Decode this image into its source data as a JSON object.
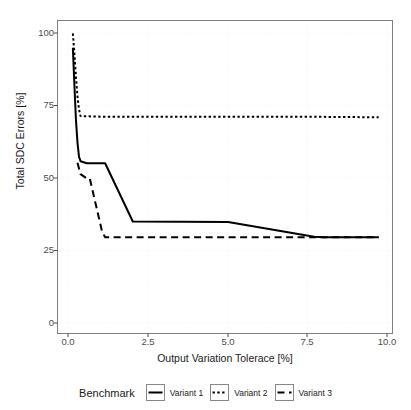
{
  "chart_data": {
    "type": "line",
    "title": "",
    "subtitle": "",
    "xlabel": "Output Variation Tolerace [%]",
    "ylabel": "Total SDC Errors [%]",
    "xlim": [
      -0.45,
      10.45
    ],
    "ylim": [
      -4.5,
      104.5
    ],
    "xticks": [
      0.0,
      2.5,
      5.0,
      7.5,
      10.0
    ],
    "xtick_labels": [
      "0.0",
      "2.5",
      "5.0",
      "7.5",
      "10.0"
    ],
    "yticks": [
      0,
      25,
      50,
      75,
      100
    ],
    "ytick_labels": [
      "0",
      "25",
      "50",
      "75",
      "100"
    ],
    "grid": true,
    "legend_position": "bottom",
    "legend_title": "Benchmark",
    "series": [
      {
        "name": "Variant 1",
        "linestyle": "solid",
        "color": "#000000",
        "x": [
          0.05,
          0.1,
          0.15,
          0.2,
          0.25,
          0.3,
          0.5,
          1.0,
          1.1,
          2.0,
          5.1,
          7.9,
          8.2,
          10.0
        ],
        "y": [
          95.0,
          82.0,
          70.0,
          62.0,
          57.0,
          55.5,
          54.8,
          54.8,
          54.8,
          34.5,
          34.3,
          29.2,
          29.0,
          29.0
        ]
      },
      {
        "name": "Variant 2",
        "linestyle": "dotted",
        "color": "#000000",
        "x": [
          0.05,
          0.1,
          0.15,
          0.2,
          0.25,
          0.3,
          1.0,
          2.5,
          5.0,
          7.5,
          10.0
        ],
        "y": [
          100.0,
          93.0,
          85.0,
          78.0,
          73.5,
          71.2,
          71.0,
          71.0,
          71.0,
          71.0,
          70.8
        ]
      },
      {
        "name": "Variant 3",
        "linestyle": "dashed",
        "color": "#000000",
        "x": [
          0.2,
          0.3,
          0.5,
          0.6,
          1.0,
          1.1,
          2.5,
          5.0,
          7.5,
          10.0
        ],
        "y": [
          55.0,
          51.0,
          49.5,
          49.5,
          31.0,
          29.0,
          29.0,
          29.0,
          29.0,
          29.0
        ]
      }
    ]
  },
  "legend": {
    "title": "Benchmark",
    "items": [
      {
        "label": "Variant 1",
        "style": "solid"
      },
      {
        "label": "Variant 2",
        "style": "dotted"
      },
      {
        "label": "Variant 3",
        "style": "dashed"
      }
    ]
  }
}
